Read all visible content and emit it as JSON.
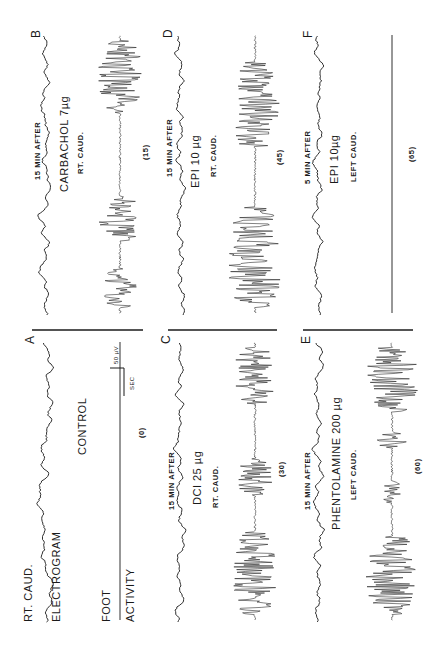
{
  "figure": {
    "orientation": "rotated-90-ccw",
    "ink_color": "#1a1a1a",
    "background": "#ffffff",
    "panels": [
      {
        "id": "A",
        "letter": "A",
        "column": 0,
        "row": 0,
        "top_label_1": "RT. CAUD.",
        "top_label_2": "ELECTROGRAM",
        "bottom_label_1": "FOOT",
        "bottom_label_2": "ACTIVITY",
        "condition": "CONTROL",
        "dose": "",
        "site": "",
        "time_after": "",
        "minutes": "(0)",
        "activity": "flat",
        "scale_bar": {
          "amplitude": "50 µV",
          "time": "SEC"
        }
      },
      {
        "id": "B",
        "letter": "B",
        "column": 1,
        "row": 0,
        "time_after": "15 MIN AFTER",
        "condition": "CARBACHOL  7µg",
        "site": "RT. CAUD.",
        "minutes": "(15)",
        "activity": "bursts",
        "bursts": [
          [
            0.02,
            0.16,
            0.8
          ],
          [
            0.26,
            0.42,
            1.0
          ],
          [
            0.72,
            0.98,
            1.0
          ]
        ]
      },
      {
        "id": "C",
        "letter": "C",
        "column": 0,
        "row": 1,
        "time_after": "15 MIN AFTER",
        "condition": "DCI   25 µg",
        "site": "RT. CAUD.",
        "minutes": "(30)",
        "activity": "bursts",
        "bursts": [
          [
            0.02,
            0.32,
            1.0
          ],
          [
            0.45,
            0.58,
            0.8
          ],
          [
            0.78,
            0.98,
            0.95
          ]
        ]
      },
      {
        "id": "D",
        "letter": "D",
        "column": 1,
        "row": 1,
        "time_after": "15 MIN AFTER",
        "condition": "EPI   10 µg",
        "site": "RT. CAUD.",
        "minutes": "(45)",
        "activity": "bursts",
        "bursts": [
          [
            0.02,
            0.38,
            1.25
          ],
          [
            0.6,
            0.9,
            1.15
          ]
        ]
      },
      {
        "id": "E",
        "letter": "E",
        "column": 0,
        "row": 2,
        "time_after": "15 MIN AFTER",
        "condition": "PHENTOLAMINE  200 µg",
        "site": "LEFT CAUD.",
        "minutes": "(60)",
        "activity": "bursts",
        "bursts": [
          [
            0.02,
            0.3,
            1.2
          ],
          [
            0.42,
            0.5,
            0.45
          ],
          [
            0.62,
            0.68,
            0.7
          ],
          [
            0.75,
            0.98,
            1.2
          ]
        ]
      },
      {
        "id": "F",
        "letter": "F",
        "column": 1,
        "row": 2,
        "time_after": "5 MIN AFTER",
        "condition": "EPI   10µg",
        "site": "LEFT CAUD.",
        "minutes": "(65)",
        "activity": "flat",
        "bursts": []
      }
    ]
  }
}
